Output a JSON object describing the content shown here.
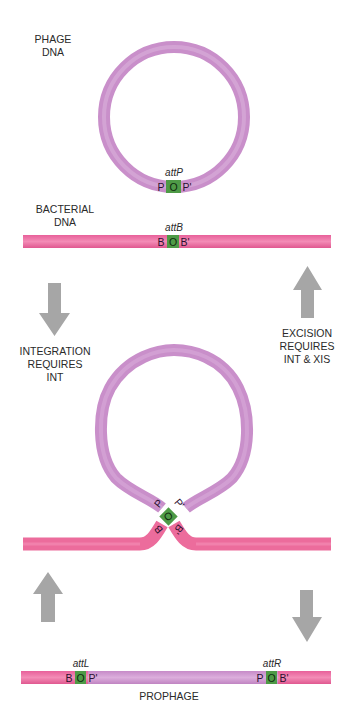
{
  "colors": {
    "phage_dna": "#cc94cc",
    "phage_dna_light": "#ddb0dd",
    "bacterial_dna": "#ec6c9c",
    "bacterial_dna_light": "#f590b8",
    "core_site": "#4e9a46",
    "arrow": "#a6a6a6",
    "text": "#2a2a2a"
  },
  "stage1": {
    "phage_label_line1": "PHAGE",
    "phage_label_line2": "DNA",
    "att_site_label": "attP",
    "att_site_parts": [
      "P",
      "O",
      "P'"
    ],
    "bacterial_label_line1": "BACTERIAL",
    "bacterial_label_line2": "DNA",
    "bacterial_att_label": "attB",
    "bacterial_att_parts": [
      "B",
      "O",
      "B'"
    ]
  },
  "integration": {
    "label_line1": "INTEGRATION",
    "label_line2": "REQUIRES",
    "label_line3": "INT",
    "arrow_direction": "down"
  },
  "excision": {
    "label_line1": "EXCISION",
    "label_line2": "REQUIRES",
    "label_line3": "INT & XIS",
    "arrow_direction": "up"
  },
  "synapsis": {
    "phage_parts": [
      "P",
      "O",
      "P'"
    ],
    "bacterial_parts": [
      "B",
      "B'"
    ]
  },
  "stage3": {
    "attL_label": "attL",
    "attL_parts": [
      "B",
      "O",
      "P'"
    ],
    "attR_label": "attR",
    "attR_parts": [
      "P",
      "O",
      "B'"
    ],
    "prophage_label": "PROPHAGE"
  }
}
